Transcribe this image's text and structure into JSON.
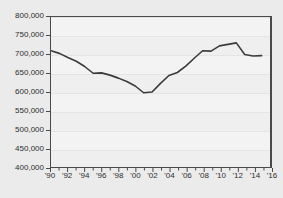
{
  "chart_data": {
    "type": "line",
    "title": "",
    "subtitle": "",
    "xlabel": "",
    "ylabel": "",
    "grid": true,
    "legend": false,
    "xlim": [
      1990,
      2016
    ],
    "ylim": [
      400000,
      800000
    ],
    "ytick_values": [
      400000,
      450000,
      500000,
      550000,
      600000,
      650000,
      700000,
      750000,
      800000
    ],
    "ytick_labels": [
      "400,000",
      "450,000",
      "500,000",
      "550,000",
      "600,000",
      "650,000",
      "700,000",
      "750,000",
      "800,000"
    ],
    "xtick_values": [
      1990,
      1992,
      1994,
      1996,
      1998,
      2000,
      2002,
      2004,
      2006,
      2008,
      2010,
      2012,
      2014,
      2016
    ],
    "xtick_labels": [
      "'90",
      "'92",
      "'94",
      "'96",
      "'98",
      "'00",
      "'02",
      "'04",
      "'06",
      "'08",
      "'10",
      "'12",
      "'14",
      "'16"
    ],
    "minor_xticks": [
      1991,
      1993,
      1995,
      1997,
      1999,
      2001,
      2003,
      2005,
      2007,
      2009,
      2011,
      2013,
      2015
    ],
    "series": [
      {
        "name": "series-1",
        "color": "#3b3b3b",
        "line_width": 1.6,
        "x": [
          1990,
          1991,
          1992,
          1993,
          1994,
          1995,
          1996,
          1997,
          1998,
          1999,
          2000,
          2001,
          2002,
          2003,
          2004,
          2005,
          2006,
          2007,
          2008,
          2009,
          2010,
          2011,
          2012,
          2013,
          2014,
          2015
        ],
        "values": [
          710000,
          703000,
          692000,
          682000,
          668000,
          650000,
          651000,
          645000,
          637000,
          628000,
          616000,
          598000,
          600000,
          623000,
          644000,
          652000,
          669000,
          690000,
          710000,
          709000,
          723000,
          727000,
          731000,
          700000,
          696000,
          697000
        ]
      }
    ]
  },
  "accent_colors": {
    "page_background": "#ebebeb",
    "plot_background": "#f3f3f3",
    "frame": "#4a4a4a",
    "gridline": "#e4e4e4",
    "line": "#3b3b3b",
    "text": "#2d2d2d"
  }
}
